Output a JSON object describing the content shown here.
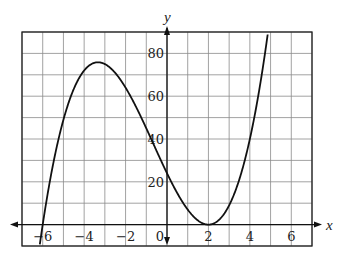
{
  "chart_data": {
    "type": "line",
    "title": "",
    "xlabel": "x",
    "ylabel": "y",
    "xlim": [
      -7,
      7
    ],
    "ylim": [
      -10,
      90
    ],
    "grid": true,
    "grid_x_step": 1,
    "grid_y_step": 10,
    "x_tick_labels": [
      "-6",
      "-4",
      "-2",
      "0",
      "2",
      "4",
      "6"
    ],
    "x_tick_values": [
      -6,
      -4,
      -2,
      0,
      2,
      4,
      6
    ],
    "y_tick_labels": [
      "20",
      "40",
      "60",
      "80"
    ],
    "y_tick_values": [
      20,
      40,
      60,
      80
    ],
    "series": [
      {
        "name": "y = (x + 6)(x - 2)^2",
        "key_points": {
          "x_intercepts": [
            -6,
            2
          ],
          "y_intercept": 24,
          "local_max": [
            -3.33,
            75.9
          ],
          "local_min": [
            2,
            0
          ]
        },
        "x": [
          -6.15,
          -6,
          -5.5,
          -5,
          -4.5,
          -4,
          -3.5,
          -3.33,
          -3,
          -2.5,
          -2,
          -1.5,
          -1,
          -0.5,
          0,
          0.5,
          1,
          1.5,
          2,
          2.5,
          3,
          3.5,
          4,
          4.5,
          4.85
        ],
        "values": [
          -9.9,
          0,
          30.6,
          49,
          60.8,
          72,
          75.4,
          75.9,
          75,
          70.9,
          64,
          55.1,
          45,
          33.8,
          24,
          14.6,
          7,
          1.9,
          0,
          2.1,
          9,
          21.4,
          40,
          65.6,
          90
        ]
      }
    ],
    "legend": null
  },
  "labels": {
    "x_axis": "x",
    "y_axis": "y",
    "origin": "0"
  },
  "colors": {
    "curve": "#111111",
    "grid": "#8a8a8a",
    "axis": "#111111",
    "frame": "#222222",
    "background": "#ffffff"
  }
}
